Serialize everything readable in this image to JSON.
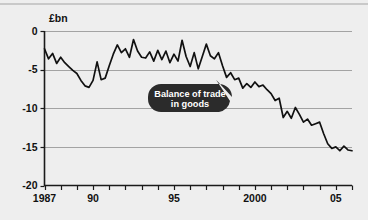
{
  "chart_data": {
    "type": "line",
    "title": "",
    "subtitle": "",
    "xlabel": "",
    "ylabel": "£bn",
    "unit_label": "£bn",
    "xlim": [
      1987,
      2006
    ],
    "ylim": [
      -20,
      0
    ],
    "y_ticks": [
      0,
      -5,
      -10,
      -15,
      -20
    ],
    "y_tick_labels": [
      "0",
      "-5",
      "-10",
      "-15",
      "-20"
    ],
    "x_ticks": [
      1987,
      1988,
      1989,
      1990,
      1991,
      1992,
      1993,
      1994,
      1995,
      1996,
      1997,
      1998,
      1999,
      2000,
      2001,
      2002,
      2003,
      2004,
      2005,
      2006
    ],
    "x_tick_labels": [
      {
        "value": 1987,
        "label": "1987"
      },
      {
        "value": 1990,
        "label": "90"
      },
      {
        "value": 1995,
        "label": "95"
      },
      {
        "value": 2000,
        "label": "2000"
      },
      {
        "value": 2005,
        "label": "05"
      }
    ],
    "grid": "horizontal",
    "gridlines_at": [
      0,
      -5,
      -10,
      -15
    ],
    "legend": "none",
    "annotations": [
      {
        "name": "balance-of-trade-callout",
        "text_line_1": "Balance of trade",
        "text_line_2": "in goods",
        "full_text": "Balance of trade in goods",
        "points_to_x": 1997.6,
        "points_to_y": -6.3,
        "background_color": "#2b2b2b",
        "text_color": "#ffffff"
      }
    ],
    "series": [
      {
        "name": "Balance of trade in goods",
        "color": "#111111",
        "x": [
          1987.0,
          1987.25,
          1987.5,
          1987.75,
          1988.0,
          1988.25,
          1988.5,
          1988.75,
          1989.0,
          1989.25,
          1989.5,
          1989.75,
          1990.0,
          1990.25,
          1990.5,
          1990.75,
          1991.0,
          1991.25,
          1991.5,
          1991.75,
          1992.0,
          1992.25,
          1992.5,
          1992.75,
          1993.0,
          1993.25,
          1993.5,
          1993.75,
          1994.0,
          1994.25,
          1994.5,
          1994.75,
          1995.0,
          1995.25,
          1995.5,
          1995.75,
          1996.0,
          1996.25,
          1996.5,
          1996.75,
          1997.0,
          1997.25,
          1997.5,
          1997.75,
          1998.0,
          1998.25,
          1998.5,
          1998.75,
          1999.0,
          1999.25,
          1999.5,
          1999.75,
          2000.0,
          2000.25,
          2000.5,
          2000.75,
          2001.0,
          2001.25,
          2001.5,
          2001.75,
          2002.0,
          2002.25,
          2002.5,
          2002.75,
          2003.0,
          2003.25,
          2003.5,
          2003.75,
          2004.0,
          2004.25,
          2004.5,
          2004.75,
          2005.0,
          2005.25,
          2005.5,
          2005.75,
          2006.0
        ],
        "y": [
          -2.3,
          -3.6,
          -2.9,
          -4.2,
          -3.4,
          -4.1,
          -4.6,
          -5.1,
          -5.5,
          -6.4,
          -7.1,
          -7.3,
          -6.4,
          -4.0,
          -6.3,
          -6.1,
          -4.5,
          -3.0,
          -1.8,
          -2.8,
          -2.3,
          -3.4,
          -1.1,
          -2.6,
          -3.4,
          -3.5,
          -2.7,
          -3.9,
          -2.5,
          -3.7,
          -2.6,
          -4.1,
          -3.0,
          -3.9,
          -1.2,
          -3.3,
          -4.6,
          -2.8,
          -4.9,
          -3.3,
          -1.7,
          -3.2,
          -3.6,
          -2.8,
          -4.5,
          -6.0,
          -5.4,
          -6.3,
          -6.1,
          -7.4,
          -6.8,
          -7.3,
          -6.6,
          -7.2,
          -7.0,
          -7.6,
          -8.1,
          -9.0,
          -8.7,
          -11.2,
          -10.4,
          -11.3,
          -9.9,
          -10.8,
          -11.8,
          -11.4,
          -12.2,
          -12.0,
          -11.8,
          -13.3,
          -14.6,
          -15.2,
          -15.0,
          -15.5,
          -14.9,
          -15.4,
          -15.5
        ]
      }
    ]
  }
}
